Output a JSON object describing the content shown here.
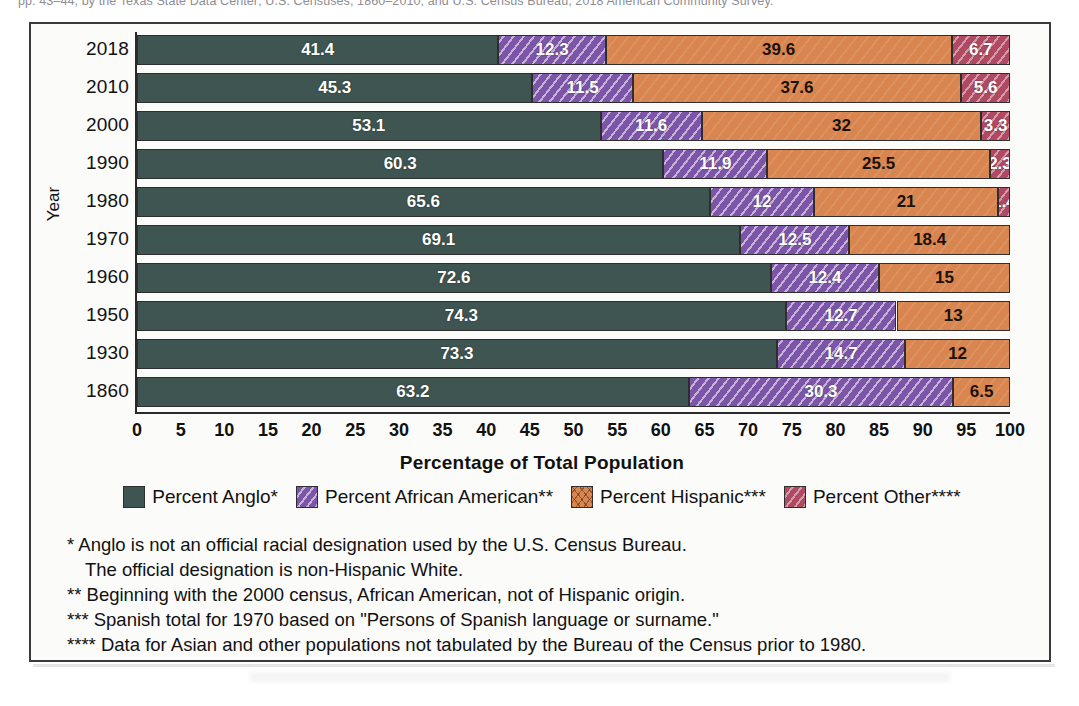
{
  "top_credit": "pp. 43–44, by the Texas State Data Center; U.S. Censuses, 1860–2010; and U.S. Census Bureau, 2018 American Community Survey.",
  "axes": {
    "y_title": "Year",
    "x_title": "Percentage of Total Population",
    "x_ticks": [
      "0",
      "5",
      "10",
      "15",
      "20",
      "25",
      "30",
      "35",
      "40",
      "45",
      "50",
      "55",
      "60",
      "65",
      "70",
      "75",
      "80",
      "85",
      "90",
      "95",
      "100"
    ],
    "x_min": 0,
    "x_max": 100
  },
  "legend": {
    "items": [
      {
        "key": "anglo",
        "label": "Percent Anglo*",
        "color": "#3f5551"
      },
      {
        "key": "african",
        "label": "Percent African American**",
        "color": "#7d55a8"
      },
      {
        "key": "hispanic",
        "label": "Percent Hispanic***",
        "color": "#d9854f"
      },
      {
        "key": "other",
        "label": "Percent Other****",
        "color": "#b04a62"
      }
    ]
  },
  "footnotes": [
    {
      "text": "* Anglo is not an official racial designation used by the U.S. Census Bureau.",
      "indent": false
    },
    {
      "text": "The official designation is non-Hispanic White.",
      "indent": true
    },
    {
      "text": "** Beginning with the 2000 census, African American, not of Hispanic origin.",
      "indent": false
    },
    {
      "text": "*** Spanish total for 1970 based on \"Persons of Spanish language or surname.\"",
      "indent": false
    },
    {
      "text": "**** Data for Asian and other populations not tabulated by the Bureau of the Census prior to 1980.",
      "indent": false
    }
  ],
  "chart_data": {
    "type": "bar",
    "orientation": "horizontal",
    "stacked": true,
    "title": "",
    "xlabel": "Percentage of Total Population",
    "ylabel": "Year",
    "xlim": [
      0,
      100
    ],
    "xtick_step": 5,
    "grid": false,
    "legend_position": "bottom",
    "categories": [
      "2018",
      "2010",
      "2000",
      "1990",
      "1980",
      "1970",
      "1960",
      "1950",
      "1930",
      "1860"
    ],
    "series": [
      {
        "name": "Percent Anglo*",
        "key": "anglo",
        "color": "#3f5551",
        "values": [
          41.4,
          45.3,
          53.1,
          60.3,
          65.6,
          69.1,
          72.6,
          74.3,
          73.3,
          63.2
        ]
      },
      {
        "name": "Percent African American**",
        "key": "african",
        "color": "#7d55a8",
        "values": [
          12.3,
          11.5,
          11.6,
          11.9,
          12,
          12.5,
          12.4,
          12.7,
          14.7,
          30.3
        ]
      },
      {
        "name": "Percent Hispanic***",
        "key": "hispanic",
        "color": "#d9854f",
        "values": [
          39.6,
          37.6,
          32,
          25.5,
          21,
          18.4,
          15,
          13,
          12,
          6.5
        ]
      },
      {
        "name": "Percent Other****",
        "key": "other",
        "color": "#b04a62",
        "values": [
          6.7,
          5.6,
          3.3,
          2.3,
          1.4,
          null,
          null,
          null,
          null,
          null
        ]
      }
    ],
    "rows": [
      {
        "year": "2018",
        "segments": [
          {
            "key": "anglo",
            "label": "41.4",
            "value": 41.4
          },
          {
            "key": "african",
            "label": "12.3",
            "value": 12.3
          },
          {
            "key": "hispanic",
            "label": "39.6",
            "value": 39.6
          },
          {
            "key": "other",
            "label": "6.7",
            "value": 6.7
          }
        ]
      },
      {
        "year": "2010",
        "segments": [
          {
            "key": "anglo",
            "label": "45.3",
            "value": 45.3
          },
          {
            "key": "african",
            "label": "11.5",
            "value": 11.5
          },
          {
            "key": "hispanic",
            "label": "37.6",
            "value": 37.6
          },
          {
            "key": "other",
            "label": "5.6",
            "value": 5.6
          }
        ]
      },
      {
        "year": "2000",
        "segments": [
          {
            "key": "anglo",
            "label": "53.1",
            "value": 53.1
          },
          {
            "key": "african",
            "label": "11.6",
            "value": 11.6
          },
          {
            "key": "hispanic",
            "label": "32",
            "value": 32
          },
          {
            "key": "other",
            "label": "3.3",
            "value": 3.3
          }
        ]
      },
      {
        "year": "1990",
        "segments": [
          {
            "key": "anglo",
            "label": "60.3",
            "value": 60.3
          },
          {
            "key": "african",
            "label": "11.9",
            "value": 11.9
          },
          {
            "key": "hispanic",
            "label": "25.5",
            "value": 25.5
          },
          {
            "key": "other",
            "label": "2.3",
            "value": 2.3
          }
        ]
      },
      {
        "year": "1980",
        "segments": [
          {
            "key": "anglo",
            "label": "65.6",
            "value": 65.6
          },
          {
            "key": "african",
            "label": "12",
            "value": 12
          },
          {
            "key": "hispanic",
            "label": "21",
            "value": 21
          },
          {
            "key": "other",
            "label": "1.4",
            "value": 1.4
          }
        ]
      },
      {
        "year": "1970",
        "segments": [
          {
            "key": "anglo",
            "label": "69.1",
            "value": 69.1
          },
          {
            "key": "african",
            "label": "12.5",
            "value": 12.5
          },
          {
            "key": "hispanic",
            "label": "18.4",
            "value": 18.4
          }
        ]
      },
      {
        "year": "1960",
        "segments": [
          {
            "key": "anglo",
            "label": "72.6",
            "value": 72.6
          },
          {
            "key": "african",
            "label": "12.4",
            "value": 12.4
          },
          {
            "key": "hispanic",
            "label": "15",
            "value": 15
          }
        ]
      },
      {
        "year": "1950",
        "segments": [
          {
            "key": "anglo",
            "label": "74.3",
            "value": 74.3
          },
          {
            "key": "african",
            "label": "12.7",
            "value": 12.7
          },
          {
            "key": "hispanic",
            "label": "13",
            "value": 13
          }
        ]
      },
      {
        "year": "1930",
        "segments": [
          {
            "key": "anglo",
            "label": "73.3",
            "value": 73.3
          },
          {
            "key": "african",
            "label": "14.7",
            "value": 14.7
          },
          {
            "key": "hispanic",
            "label": "12",
            "value": 12
          }
        ]
      },
      {
        "year": "1860",
        "segments": [
          {
            "key": "anglo",
            "label": "63.2",
            "value": 63.2
          },
          {
            "key": "african",
            "label": "30.3",
            "value": 30.3
          },
          {
            "key": "hispanic",
            "label": "6.5",
            "value": 6.5
          }
        ]
      }
    ]
  }
}
